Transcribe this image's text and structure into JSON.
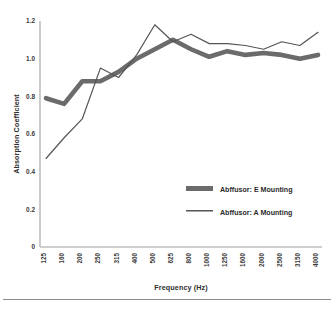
{
  "chart_data": {
    "type": "line",
    "title": "",
    "xlabel": "Frequency (Hz)",
    "ylabel": "Absorption Coefficient",
    "categories": [
      "125",
      "160",
      "200",
      "250",
      "315",
      "400",
      "500",
      "625",
      "800",
      "1000",
      "1250",
      "1600",
      "2000",
      "2500",
      "3150",
      "4000"
    ],
    "ylim": [
      0,
      1.2
    ],
    "yticks": [
      "0",
      "0.2",
      "0.4",
      "0.6",
      "0.8",
      "1.0",
      "1.2"
    ],
    "ytick_values": [
      0,
      0.2,
      0.4,
      0.6,
      0.8,
      1.0,
      1.2
    ],
    "grid": false,
    "legend_position": "inside-lower-right",
    "series": [
      {
        "name": "Abffusor: E Mounting",
        "color": "#6b6b6b",
        "line_width": "thick",
        "values": [
          0.79,
          0.76,
          0.88,
          0.88,
          0.93,
          1.0,
          1.05,
          1.1,
          1.05,
          1.01,
          1.04,
          1.02,
          1.03,
          1.02,
          1.0,
          1.02
        ]
      },
      {
        "name": "Abffusor: A Mounting",
        "color": "#555555",
        "line_width": "thin",
        "values": [
          0.47,
          0.58,
          0.68,
          0.95,
          0.9,
          1.02,
          1.18,
          1.09,
          1.13,
          1.08,
          1.08,
          1.07,
          1.05,
          1.09,
          1.07,
          1.14
        ]
      }
    ]
  },
  "axes": {
    "y_title": "Absorption Coefficient",
    "x_title": "Frequency (Hz)"
  },
  "legend": {
    "items": [
      {
        "label": "Abffusor: E Mounting",
        "swatch": "thick-gray-line"
      },
      {
        "label": "Abffusor: A Mounting",
        "swatch": "thin-gray-line"
      }
    ]
  }
}
